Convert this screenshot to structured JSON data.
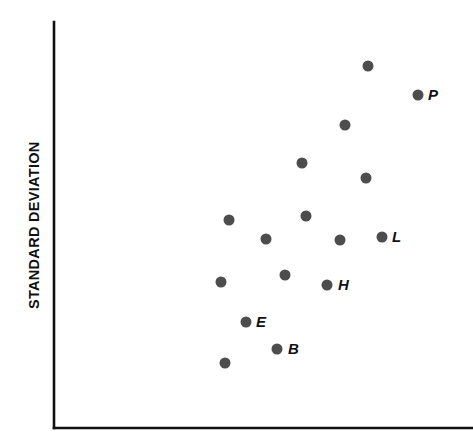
{
  "figure": {
    "width": 473,
    "height": 442,
    "background_color": "#ffffff"
  },
  "axes": {
    "y_axis_title": "STANDARD DEVIATION",
    "x_axis_title": "",
    "axis_color": "#111111",
    "origin_x": 54,
    "origin_y": 428,
    "y_axis_top": 22,
    "x_axis_right": 473,
    "ticks_shown": "none",
    "grid": "off"
  },
  "marker_style": {
    "shape": "circle",
    "color": "#4d4d4d",
    "radius": 5.5,
    "label_style": "bold-italic"
  },
  "chart_data": {
    "type": "scatter",
    "title": "",
    "xlabel": "",
    "ylabel": "STANDARD DEVIATION",
    "xlim": [
      54,
      473
    ],
    "ylim": [
      22,
      428
    ],
    "grid": false,
    "legend": "none",
    "axis_ticks": false,
    "note": "Unlabeled axes; values given in pixel coordinates of the plot area. Labeled points: P, L, H, E, B.",
    "points": [
      {
        "id": "pt-1",
        "label": "",
        "x": 368,
        "y": 66,
        "label_dx": 0,
        "label_dy": 0
      },
      {
        "id": "pt-2",
        "label": "P",
        "x": 418,
        "y": 95,
        "label_dx": 10,
        "label_dy": 1
      },
      {
        "id": "pt-3",
        "label": "",
        "x": 345,
        "y": 125,
        "label_dx": 0,
        "label_dy": 0
      },
      {
        "id": "pt-4",
        "label": "",
        "x": 302,
        "y": 163,
        "label_dx": 0,
        "label_dy": 0
      },
      {
        "id": "pt-5",
        "label": "",
        "x": 366,
        "y": 178,
        "label_dx": 0,
        "label_dy": 0
      },
      {
        "id": "pt-6",
        "label": "",
        "x": 229,
        "y": 220,
        "label_dx": 0,
        "label_dy": 0
      },
      {
        "id": "pt-7",
        "label": "",
        "x": 306,
        "y": 216,
        "label_dx": 0,
        "label_dy": 0
      },
      {
        "id": "pt-8",
        "label": "L",
        "x": 382,
        "y": 237,
        "label_dx": 10,
        "label_dy": 1
      },
      {
        "id": "pt-9",
        "label": "",
        "x": 266,
        "y": 239,
        "label_dx": 0,
        "label_dy": 0
      },
      {
        "id": "pt-10",
        "label": "",
        "x": 340,
        "y": 240,
        "label_dx": 0,
        "label_dy": 0
      },
      {
        "id": "pt-11",
        "label": "",
        "x": 285,
        "y": 275,
        "label_dx": 0,
        "label_dy": 0
      },
      {
        "id": "pt-12",
        "label": "",
        "x": 221,
        "y": 282,
        "label_dx": 0,
        "label_dy": 0
      },
      {
        "id": "pt-13",
        "label": "H",
        "x": 327,
        "y": 285,
        "label_dx": 11,
        "label_dy": 1
      },
      {
        "id": "pt-14",
        "label": "E",
        "x": 246,
        "y": 322,
        "label_dx": 10,
        "label_dy": 1
      },
      {
        "id": "pt-15",
        "label": "B",
        "x": 277,
        "y": 349,
        "label_dx": 11,
        "label_dy": 1
      },
      {
        "id": "pt-16",
        "label": "",
        "x": 225,
        "y": 363,
        "label_dx": 0,
        "label_dy": 0
      }
    ]
  }
}
